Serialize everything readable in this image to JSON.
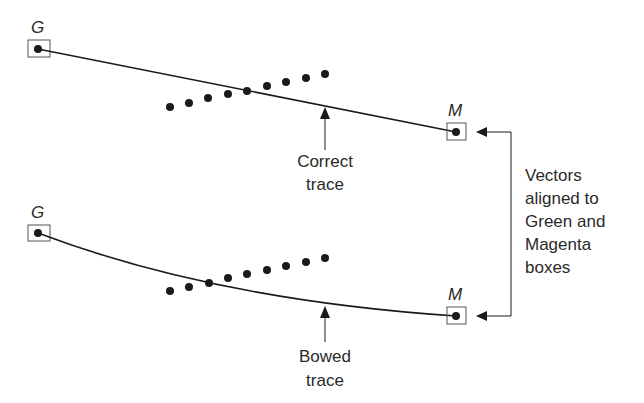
{
  "diagram": {
    "top_panel": {
      "start_label": "G",
      "end_label": "M",
      "annotation": [
        "Correct",
        "trace"
      ],
      "trace_type": "straight",
      "start_point": [
        38,
        49
      ],
      "end_point": [
        456,
        132
      ],
      "dots": [
        [
          170,
          107
        ],
        [
          189,
          103
        ],
        [
          208,
          98
        ],
        [
          228,
          94
        ],
        [
          247,
          91
        ],
        [
          267,
          86
        ],
        [
          286,
          82
        ],
        [
          306,
          78
        ],
        [
          325,
          74
        ]
      ]
    },
    "bottom_panel": {
      "start_label": "G",
      "end_label": "M",
      "annotation": [
        "Bowed",
        "trace"
      ],
      "trace_type": "bowed",
      "start_point": [
        38,
        233
      ],
      "end_point": [
        456,
        316
      ],
      "dots": [
        [
          170,
          291
        ],
        [
          189,
          287
        ],
        [
          209,
          283
        ],
        [
          228,
          278
        ],
        [
          247,
          274
        ],
        [
          267,
          270
        ],
        [
          286,
          266
        ],
        [
          306,
          262
        ],
        [
          325,
          258
        ]
      ]
    },
    "side_note": [
      "Vectors",
      "aligned to",
      "Green and",
      "Magenta",
      "boxes"
    ],
    "colors": {
      "ink": "#1a1a1a",
      "box_stroke": "#555555",
      "text": "#2a2a2a"
    }
  }
}
